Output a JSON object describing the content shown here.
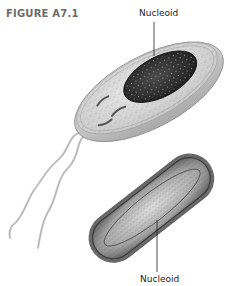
{
  "figure": {
    "label": "FIGURE A7.1",
    "callouts": {
      "top": "Nucleoid",
      "bottom": "Nucleoid"
    },
    "panels": [
      {
        "name": "bacterium-illustration",
        "description": "Illustrated rod-shaped bacterium with flagella and nucleoid"
      },
      {
        "name": "bacterium-micrograph",
        "description": "Electron micrograph of a rod-shaped bacterium showing nucleoid"
      }
    ],
    "colors": {
      "label_gray": "#6b6b6b",
      "nucleoid_dark": "#2a2a2a",
      "cytoplasm": "#d8d8d8",
      "cell_wall": "#bdbdbd",
      "micrograph_edge": "#555555"
    }
  }
}
